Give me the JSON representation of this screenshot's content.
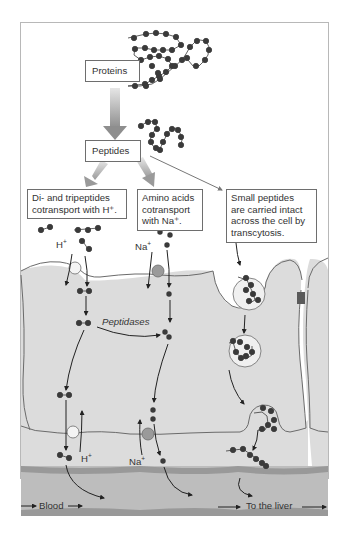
{
  "boxes": {
    "proteins": "Proteins",
    "peptides": "Peptides",
    "di_tripeptides": "Di- and tripeptides\ncotransport with H⁺.",
    "amino_acids": "Amino acids\ncotransport\nwith Na⁺.",
    "small_peptides": "Small peptides\nare carried intact\nacross the cell by\ntranscytosis."
  },
  "labels": {
    "h_plus_top": "H",
    "h_plus_top_sup": "+",
    "na_plus_top": "Na",
    "na_plus_top_sup": "+",
    "peptidases": "Peptidases",
    "h_plus_bottom": "H",
    "h_plus_bottom_sup": "+",
    "na_plus_bottom": "Na",
    "na_plus_bottom_sup": "+",
    "blood": "Blood",
    "to_the_liver": "To the liver"
  },
  "colors": {
    "cell_fill": "#dcdcdc",
    "cell_outline": "#6b6b6b",
    "blood_vessel": "#b9b9b9",
    "blood_vessel_edge": "#8f8f8f",
    "molecule": "#3a3a3a",
    "na_transporter": "#9a9a9a",
    "h_transporter": "#f4f4f4",
    "junction": "#5a5a5a",
    "big_arrow": "#9c9c9c"
  }
}
